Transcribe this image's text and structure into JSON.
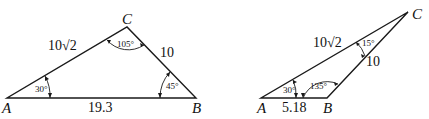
{
  "figure": {
    "triangle_1": {
      "vertices": {
        "A": "A",
        "B": "B",
        "C": "C"
      },
      "sides": {
        "AC": "10√2",
        "BC": "10",
        "AB": "19.3"
      },
      "angles": {
        "A": "30°",
        "C": "105°",
        "B": "45°"
      }
    },
    "triangle_2": {
      "vertices": {
        "A": "A",
        "B": "B",
        "C": "C"
      },
      "sides": {
        "AC": "10√2",
        "BC": "10",
        "AB": "5.18"
      },
      "angles": {
        "A": "30°",
        "C": "15°",
        "B": "135°"
      }
    }
  }
}
